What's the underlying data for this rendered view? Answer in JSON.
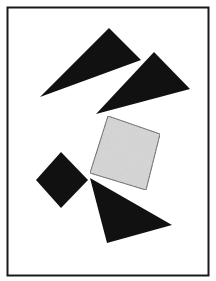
{
  "figure": {
    "frame": {
      "x": 7.5,
      "y": 7.5,
      "width": 201,
      "height": 268,
      "stroke": "#1a1a1a",
      "stroke_width": 2
    },
    "colors": {
      "background": "#ffffff",
      "dark_fill": "#111111",
      "gray_fill": "#d9d9d9",
      "gray_stroke": "#444444"
    },
    "shapes": [
      {
        "name": "triangle-top-left",
        "kind": "triangle",
        "fill": "dark",
        "points": "109,28 141,60 40,97"
      },
      {
        "name": "triangle-top-right",
        "kind": "triangle",
        "fill": "dark",
        "points": "154,52 190,89 96,114"
      },
      {
        "name": "square-gray",
        "kind": "square",
        "fill": "gray",
        "points": "108,116 160,134 146,190 90,173"
      },
      {
        "name": "diamond-left",
        "kind": "square",
        "fill": "dark",
        "points": "61,152 88,180 61,208 36,180"
      },
      {
        "name": "triangle-bottom",
        "kind": "triangle",
        "fill": "dark",
        "points": "90,178 172,225 107,243"
      }
    ]
  }
}
